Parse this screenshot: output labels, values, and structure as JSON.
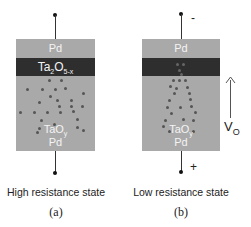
{
  "panels": [
    {
      "id": "a",
      "top_electrode": "Pd",
      "oxide_layer": "Ta",
      "oxide_layer_sub1": "2",
      "oxide_layer_mid": "O",
      "oxide_layer_sub2": "5-x",
      "base_oxide": "TaO",
      "base_oxide_sub": "y",
      "bottom_electrode": "Pd",
      "caption": "High resistance state",
      "sublabel": "(a)"
    },
    {
      "id": "b",
      "top_electrode": "Pd",
      "base_oxide": "TaO",
      "base_oxide_sub": "y",
      "bottom_electrode": "Pd",
      "top_polarity": "-",
      "bottom_polarity": "+",
      "arrow_label": "V",
      "arrow_label_sub": "O",
      "caption": "Low resistance state",
      "sublabel": "(b)"
    }
  ],
  "colors": {
    "electrode_layer": "#a9a9a9",
    "dark_layer": "#2e2e2e",
    "vacancy_dot": "#555555"
  }
}
